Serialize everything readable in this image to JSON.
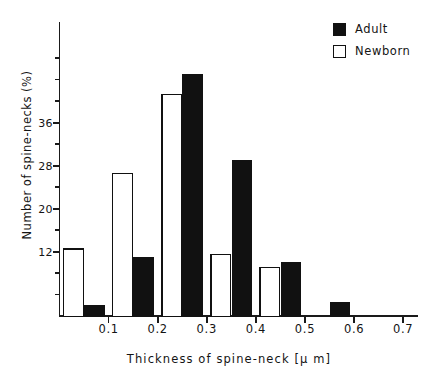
{
  "chart_data": {
    "type": "bar",
    "title": "",
    "subtitle": "",
    "xlabel": "Thickness of spine-neck [μ m]",
    "ylabel": "Number of spine-necks (%)",
    "categories": [
      "0.0-0.1",
      "0.1-0.2",
      "0.2-0.3",
      "0.3-0.4",
      "0.4-0.5",
      "0.5-0.6"
    ],
    "bin_centers": [
      0.05,
      0.15,
      0.25,
      0.35,
      0.45,
      0.55
    ],
    "bin_width": 0.1,
    "series": [
      {
        "name": "Newborn",
        "color": "#ffffff",
        "edge_color": "#111111",
        "fill": "open",
        "values": [
          12.5,
          26.5,
          41.3,
          11.5,
          9.0,
          0.0
        ]
      },
      {
        "name": "Adult",
        "color": "#111111",
        "edge_color": "#111111",
        "fill": "solid",
        "values": [
          2.0,
          11.0,
          45.0,
          29.0,
          10.0,
          2.5
        ]
      }
    ],
    "xlim": [
      0.0,
      0.76
    ],
    "ylim": [
      0,
      50
    ],
    "xticks": [
      0.1,
      0.2,
      0.3,
      0.4,
      0.5,
      0.6,
      0.7
    ],
    "xtick_labels": [
      "0.1",
      "0.2",
      "0.3",
      "0.4",
      "0.5",
      "0.6",
      "0.7"
    ],
    "yticks_major": [
      12,
      20,
      28,
      36
    ],
    "ytick_labels": [
      "12",
      "20",
      "28",
      "36"
    ],
    "yticks_minor": [
      4,
      8,
      16,
      24,
      32,
      40,
      44,
      48
    ],
    "grid": false,
    "legend_position": "top-right"
  },
  "legend": {
    "items": [
      {
        "label": "Adult",
        "marker": "filled-square"
      },
      {
        "label": "Newborn",
        "marker": "open-square"
      }
    ]
  },
  "axes": {
    "ylabel": "Number of spine-necks (%)",
    "xlabel": "Thickness of spine-neck [μ m]"
  }
}
